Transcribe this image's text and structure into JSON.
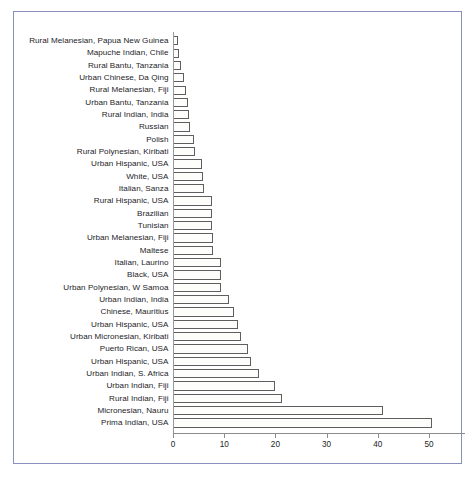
{
  "chart_data": {
    "type": "bar",
    "orientation": "horizontal",
    "title": "",
    "subtitle": "",
    "xlabel": "",
    "ylabel": "",
    "xlim": [
      0,
      55
    ],
    "ylim": null,
    "grid": false,
    "legend": null,
    "xticks": [
      0,
      10,
      20,
      30,
      40,
      50
    ],
    "xtick_labels": [
      "0",
      "10",
      "20",
      "30",
      "40",
      "50"
    ],
    "categories": [
      "Rural Melanesian, Papua New Guinea",
      "Mapuche Indian, Chile",
      "Rural Bantu, Tanzania",
      "Urban Chinese, Da Qing",
      "Rural Melanesian, Fiji",
      "Urban Bantu, Tanzania",
      "Rural Indian, India",
      "Russian",
      "Polish",
      "Rural Polynesian, Kiribati",
      "Urban Hispanic, USA",
      "White, USA",
      "Italian, Sanza",
      "Rural Hispanic, USA",
      "Brazilian",
      "Tunisian",
      "Urban Melanesian, Fiji",
      "Maltese",
      "Italian, Laurino",
      "Black, USA",
      "Urban Polynesian, W Samoa",
      "Urban Indian, India",
      "Chinese, Mauritius",
      "Urban Hispanic, USA",
      "Urban Micronesian, Kiribati",
      "Puerto Rican, USA",
      "Urban Hispanic, USA",
      "Urban Indian, S. Africa",
      "Urban Indian, Fiji",
      "Rural Indian, Fiji",
      "Micronesian, Nauru",
      "Prima Indian, USA"
    ],
    "values": [
      1.0,
      1.1,
      1.6,
      2.1,
      2.6,
      3.0,
      3.1,
      3.4,
      4.1,
      4.3,
      5.6,
      5.8,
      6.0,
      7.6,
      7.7,
      7.7,
      7.9,
      7.9,
      9.3,
      9.4,
      9.4,
      11.0,
      11.9,
      12.6,
      13.2,
      14.6,
      15.2,
      16.8,
      20.0,
      21.3,
      41.0,
      50.5
    ],
    "series_name": "Prevalence (%)"
  },
  "figure": {
    "frame_color": "#8a90bd",
    "bar_fill": "#fdfdfc",
    "bar_edge": "#5e5e5e",
    "axis_color": "#8c8c8c",
    "text_color": "#23231f",
    "background": "#ffffff"
  }
}
